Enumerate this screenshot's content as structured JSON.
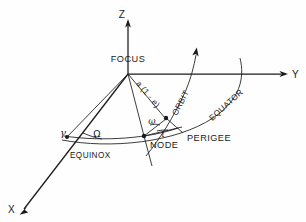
{
  "figure": {
    "type": "orbital-elements-diagram",
    "background_color": "#fefefe",
    "ink_color": "#1a1a1a"
  },
  "axes": [
    {
      "id": "z",
      "label": "Z",
      "direction": "up"
    },
    {
      "id": "y",
      "label": "Y",
      "direction": "right"
    },
    {
      "id": "x",
      "label": "X",
      "direction": "down-left"
    }
  ],
  "points": [
    {
      "id": "focus",
      "label": "FOCUS",
      "marker": false
    },
    {
      "id": "node",
      "label": "NODE",
      "marker": true
    },
    {
      "id": "perigee",
      "label": "PERIGEE",
      "marker": true
    },
    {
      "id": "equinox",
      "label": "EQUINOX",
      "marker": true,
      "symbol": "γ"
    }
  ],
  "curves": [
    {
      "id": "orbit",
      "label": "ORBIT",
      "rotation_deg": -62
    },
    {
      "id": "equator",
      "label": "EQUATOR",
      "rotation_deg": -42
    }
  ],
  "measures": [
    {
      "id": "radius-perigee",
      "label": "a (1 - e)",
      "rotation_deg": 64,
      "meaning": "perigee radius"
    },
    {
      "id": "raan",
      "symbol": "Ω",
      "meaning": "right ascension of ascending node"
    },
    {
      "id": "arg-perigee",
      "symbol": "ω",
      "meaning": "argument of perigee"
    },
    {
      "id": "inclination",
      "symbol": "ι",
      "meaning": "inclination"
    }
  ]
}
